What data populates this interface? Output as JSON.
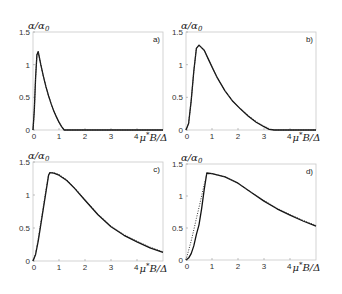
{
  "chart_data": [
    {
      "type": "line",
      "panel": "a)",
      "ylabel": "α/α₀",
      "xlabel": "μ*B/Δ",
      "xlim": [
        0,
        5
      ],
      "ylim": [
        0,
        1.5
      ],
      "xticks": [
        "0",
        "1",
        "2",
        "3",
        "4"
      ],
      "yticks": [
        "0",
        "0.5",
        "1",
        "1.5"
      ],
      "series": [
        {
          "name": "solid",
          "style": "solid",
          "x": [
            0,
            0.05,
            0.1,
            0.15,
            0.2,
            0.3,
            0.4,
            0.5,
            0.6,
            0.7,
            0.8,
            0.9,
            1.0,
            1.1,
            1.2,
            1.3,
            2,
            3,
            4,
            5
          ],
          "y": [
            0,
            0.3,
            0.8,
            1.15,
            1.2,
            1.0,
            0.82,
            0.66,
            0.52,
            0.4,
            0.29,
            0.2,
            0.12,
            0.05,
            0.0,
            0,
            0,
            0,
            0,
            0
          ]
        },
        {
          "name": "dotted",
          "style": "dotted",
          "x": [
            0,
            0.05,
            0.1,
            0.15,
            0.2,
            0.3,
            0.4,
            0.5,
            0.6,
            0.7,
            0.8,
            0.9,
            1.0,
            1.1,
            1.2,
            1.3,
            2,
            3,
            4,
            5
          ],
          "y": [
            0,
            0.3,
            0.8,
            1.15,
            1.2,
            1.0,
            0.82,
            0.66,
            0.52,
            0.4,
            0.29,
            0.2,
            0.12,
            0.05,
            0.0,
            0,
            0,
            0,
            0,
            0
          ]
        }
      ]
    },
    {
      "type": "line",
      "panel": "b)",
      "ylabel": "α/α₀",
      "xlabel": "μ*B/Δ",
      "xlim": [
        0,
        5
      ],
      "ylim": [
        0,
        1.5
      ],
      "xticks": [
        "0",
        "1",
        "2",
        "3",
        "4"
      ],
      "yticks": [
        "0",
        "0.5",
        "1",
        "1.5"
      ],
      "series": [
        {
          "name": "solid",
          "style": "solid",
          "x": [
            0,
            0.1,
            0.2,
            0.3,
            0.4,
            0.5,
            0.7,
            0.9,
            1.2,
            1.5,
            1.8,
            2.1,
            2.4,
            2.7,
            3.0,
            3.2,
            3.4,
            4,
            5
          ],
          "y": [
            0,
            0.1,
            0.45,
            0.9,
            1.25,
            1.3,
            1.22,
            1.05,
            0.8,
            0.6,
            0.44,
            0.32,
            0.21,
            0.12,
            0.05,
            0.01,
            0,
            0,
            0
          ]
        },
        {
          "name": "dotted",
          "style": "dotted",
          "x": [
            0,
            0.1,
            0.2,
            0.3,
            0.4,
            0.5,
            0.7,
            0.9,
            1.2,
            1.5,
            1.8,
            2.1,
            2.4,
            2.7,
            3.0,
            3.2,
            3.4,
            4,
            5
          ],
          "y": [
            0,
            0.1,
            0.45,
            0.9,
            1.25,
            1.3,
            1.22,
            1.05,
            0.8,
            0.6,
            0.44,
            0.32,
            0.22,
            0.13,
            0.06,
            0.02,
            0,
            0,
            0
          ]
        }
      ]
    },
    {
      "type": "line",
      "panel": "c)",
      "ylabel": "α/α₀",
      "xlabel": "μ*B/Δ",
      "xlim": [
        0,
        5
      ],
      "ylim": [
        0,
        1.5
      ],
      "xticks": [
        "0",
        "1",
        "2",
        "3",
        "4"
      ],
      "yticks": [
        "0",
        "0.5",
        "1",
        "1.5"
      ],
      "series": [
        {
          "name": "solid",
          "style": "solid",
          "x": [
            0,
            0.1,
            0.2,
            0.3,
            0.4,
            0.5,
            0.6,
            0.65,
            0.8,
            1.0,
            1.3,
            1.6,
            2.0,
            2.5,
            3.0,
            3.5,
            4.0,
            4.5,
            5.0
          ],
          "y": [
            0,
            0.1,
            0.3,
            0.55,
            0.8,
            1.05,
            1.3,
            1.34,
            1.33,
            1.3,
            1.22,
            1.1,
            0.92,
            0.7,
            0.52,
            0.39,
            0.29,
            0.2,
            0.13
          ]
        },
        {
          "name": "dotted",
          "style": "dotted",
          "x": [
            0,
            0.1,
            0.2,
            0.3,
            0.4,
            0.5,
            0.6,
            0.65,
            0.8,
            1.0,
            1.3,
            1.6,
            2.0,
            2.5,
            3.0,
            3.5,
            4.0,
            4.5,
            5.0
          ],
          "y": [
            0,
            0.12,
            0.33,
            0.58,
            0.83,
            1.08,
            1.32,
            1.34,
            1.34,
            1.31,
            1.23,
            1.11,
            0.93,
            0.71,
            0.53,
            0.4,
            0.3,
            0.21,
            0.14
          ]
        }
      ]
    },
    {
      "type": "line",
      "panel": "d)",
      "ylabel": "α/α₀",
      "xlabel": "μ*B/Δ",
      "xlim": [
        0,
        5
      ],
      "ylim": [
        0,
        1.5
      ],
      "xticks": [
        "0",
        "1",
        "2",
        "3",
        "4"
      ],
      "yticks": [
        "0",
        "0.5",
        "1",
        "1.5"
      ],
      "series": [
        {
          "name": "solid",
          "style": "solid",
          "x": [
            0,
            0.1,
            0.2,
            0.3,
            0.4,
            0.5,
            0.6,
            0.7,
            0.8,
            1.0,
            1.5,
            2.0,
            2.5,
            3.0,
            3.5,
            4.0,
            4.5,
            5.0
          ],
          "y": [
            0,
            0.03,
            0.1,
            0.22,
            0.4,
            0.55,
            0.8,
            1.1,
            1.36,
            1.35,
            1.3,
            1.2,
            1.06,
            0.92,
            0.8,
            0.7,
            0.61,
            0.53
          ]
        },
        {
          "name": "dotted",
          "style": "dotted",
          "x": [
            0,
            0.1,
            0.2,
            0.3,
            0.4,
            0.5,
            0.6,
            0.7,
            0.8,
            1.0,
            1.5,
            2.0,
            2.5,
            3.0,
            3.5,
            4.0,
            4.5,
            5.0
          ],
          "y": [
            0,
            0.15,
            0.3,
            0.47,
            0.65,
            0.82,
            1.0,
            1.18,
            1.34,
            1.35,
            1.3,
            1.2,
            1.06,
            0.93,
            0.81,
            0.71,
            0.62,
            0.54
          ]
        }
      ]
    }
  ],
  "panels": [
    {
      "label": "a)",
      "ylabel": "α/α",
      "ysub": "0",
      "xlabel_num": "4",
      "xlabel": "μ",
      "xsup": "*",
      "xrest": "B/Δ"
    },
    {
      "label": "b)",
      "ylabel": "α/α",
      "ysub": "0",
      "xlabel_num": "4",
      "xlabel": "μ",
      "xsup": "*",
      "xrest": "B/Δ"
    },
    {
      "label": "c)",
      "ylabel": "α/α",
      "ysub": "0",
      "xlabel_num": "4",
      "xlabel": "μ",
      "xsup": "*",
      "xrest": "B/Δ"
    },
    {
      "label": "d)",
      "ylabel": "α/α",
      "ysub": "0",
      "xlabel_num": "4",
      "xlabel": "μ",
      "xsup": "*",
      "xrest": "B/Δ"
    }
  ]
}
